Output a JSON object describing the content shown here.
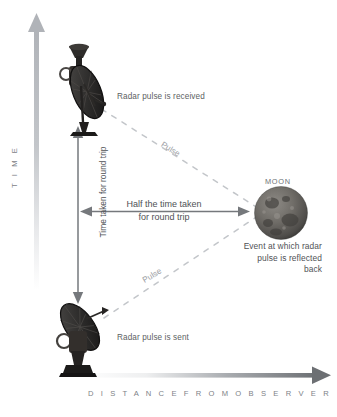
{
  "diagram": {
    "axes": {
      "time_label": "T I M E",
      "distance_label": "D I S T A N C E   F R O M   O B S E R V E R"
    },
    "measures": {
      "round_trip_label": "Time taken for round trip",
      "half_trip_label": "Half the time taken\nfor round trip"
    },
    "events": {
      "received": "Radar pulse is received",
      "sent": "Radar pulse is sent",
      "moon": "MOON",
      "reflection": "Event at which radar\npulse is reflected\nback"
    },
    "pulses": {
      "upper": "Pulse",
      "lower": "Pulse"
    },
    "icons": {
      "dish_top": "satellite-dish-icon",
      "dish_bottom": "satellite-dish-icon",
      "moon": "moon-icon"
    },
    "colors": {
      "background": "#ffffff",
      "axis_gray": "#b9bcc0",
      "measure_arrow": "#6f7276",
      "text": "#4f5155",
      "pulse_dash": "#c2c5c9",
      "moon_body": "#6d6a66"
    }
  }
}
